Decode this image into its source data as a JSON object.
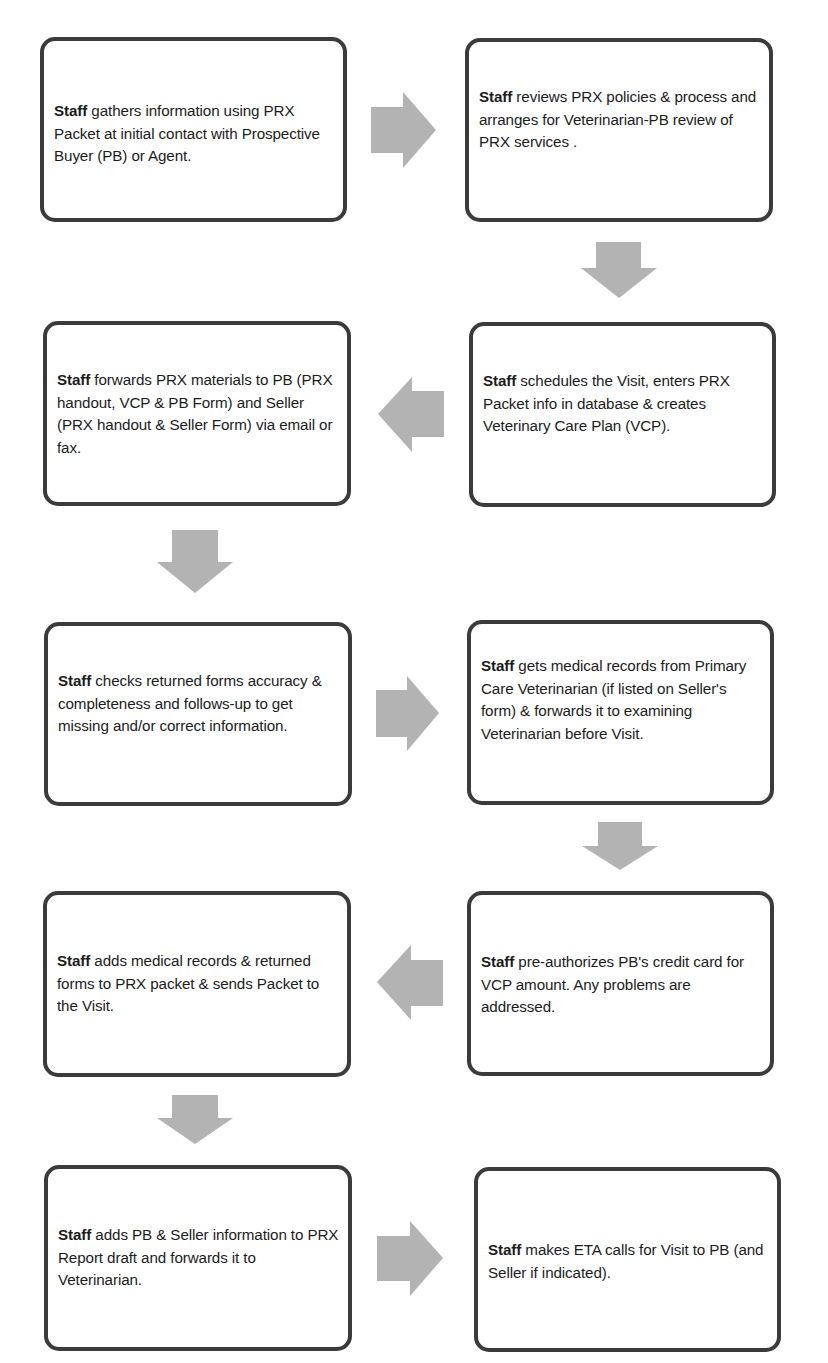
{
  "diagram": {
    "type": "process-flowchart",
    "colors": {
      "box_border": "#3b3b3b",
      "box_fill": "#ffffff",
      "arrow_fill": "#b3b3b3",
      "text": "#1c1c1c"
    },
    "steps": [
      {
        "id": 1,
        "actor": "Staff",
        "text": " gathers information using PRX Packet at initial contact with Prospective Buyer (PB) or Agent."
      },
      {
        "id": 2,
        "actor": "Staff",
        "text": " reviews PRX policies & process and arranges for Veterinarian-PB review of PRX services ."
      },
      {
        "id": 3,
        "actor": "Staff",
        "text": " forwards PRX materials to PB  (PRX handout, VCP & PB Form) and Seller (PRX handout & Seller Form) via email or fax."
      },
      {
        "id": 4,
        "actor": "Staff",
        "text": " schedules the Visit, enters PRX Packet info in database & creates Veterinary Care Plan (VCP)."
      },
      {
        "id": 5,
        "actor": "Staff",
        "text": " checks returned forms accuracy & completeness and follows-up to get missing and/or correct information."
      },
      {
        "id": 6,
        "actor": "Staff",
        "text": " gets medical records from Primary Care Veterinarian (if listed on Seller's form) & forwards it to examining Veterinarian before Visit."
      },
      {
        "id": 7,
        "actor": "Staff",
        "text": " adds medical records & returned forms to PRX packet & sends Packet to the Visit."
      },
      {
        "id": 8,
        "actor": "Staff",
        "text": " pre-authorizes  PB's credit card for VCP amount. Any problems are addressed."
      },
      {
        "id": 9,
        "actor": "Staff",
        "text": " adds PB & Seller information to PRX Report draft and forwards it to Veterinarian."
      },
      {
        "id": 10,
        "actor": "Staff",
        "text": " makes ETA calls for Visit to PB (and Seller if indicated)."
      }
    ],
    "arrows": [
      {
        "from": 1,
        "to": 2,
        "direction": "right"
      },
      {
        "from": 2,
        "to": 4,
        "direction": "down"
      },
      {
        "from": 4,
        "to": 3,
        "direction": "left"
      },
      {
        "from": 3,
        "to": 5,
        "direction": "down"
      },
      {
        "from": 5,
        "to": 6,
        "direction": "right"
      },
      {
        "from": 6,
        "to": 8,
        "direction": "down"
      },
      {
        "from": 8,
        "to": 7,
        "direction": "left"
      },
      {
        "from": 7,
        "to": 9,
        "direction": "down"
      },
      {
        "from": 9,
        "to": 10,
        "direction": "right"
      }
    ]
  }
}
